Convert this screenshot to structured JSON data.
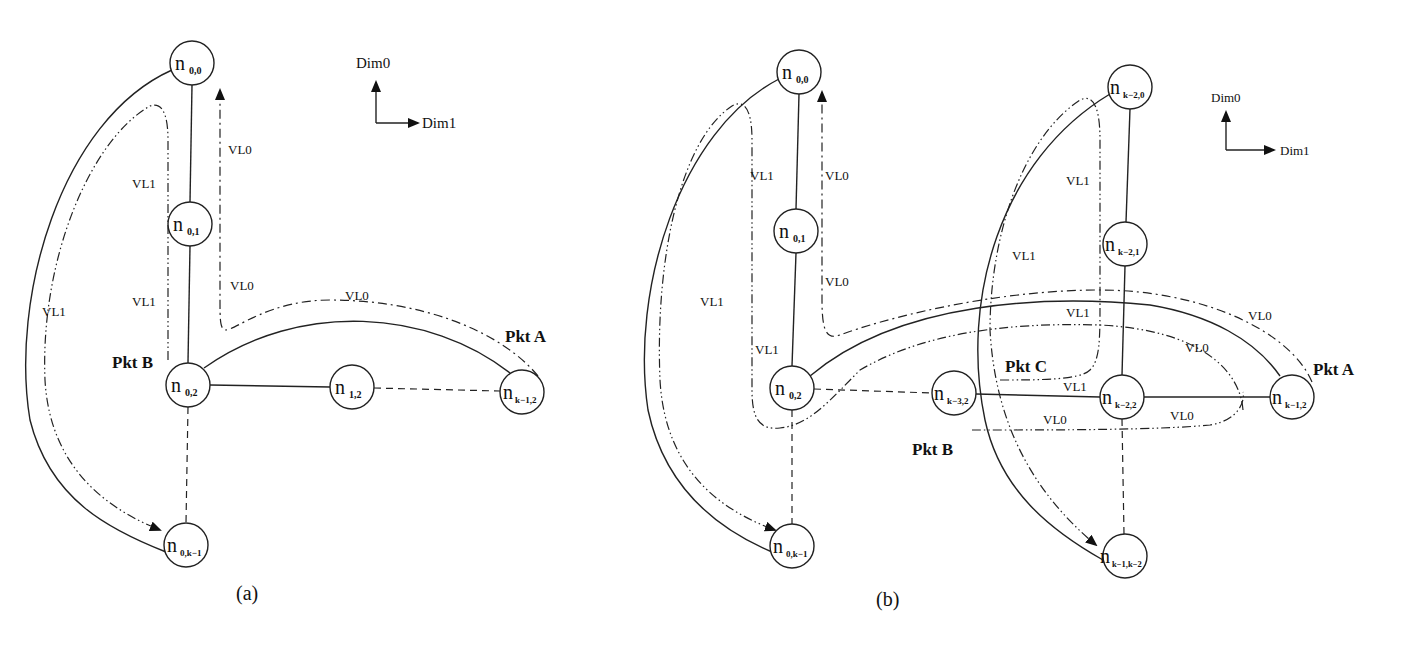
{
  "figure": {
    "panels": [
      {
        "caption": "(a)",
        "axes": {
          "up": "Dim0",
          "right": "Dim1"
        },
        "nodes": [
          {
            "id": "n00",
            "base": "n",
            "sub": "0,0"
          },
          {
            "id": "n01",
            "base": "n",
            "sub": "0,1"
          },
          {
            "id": "n02",
            "base": "n",
            "sub": "0,2"
          },
          {
            "id": "n12",
            "base": "n",
            "sub": "1,2"
          },
          {
            "id": "nk12",
            "base": "n",
            "sub": "k−1,2"
          },
          {
            "id": "n0k1",
            "base": "n",
            "sub": "0,k−1"
          }
        ],
        "vl_labels": [
          "VL0",
          "VL1",
          "VL0",
          "VL1",
          "VL1",
          "VL0"
        ],
        "packets": [
          "Pkt A",
          "Pkt B"
        ]
      },
      {
        "caption": "(b)",
        "axes": {
          "up": "Dim0",
          "right": "Dim1"
        },
        "nodes": [
          {
            "id": "n00",
            "base": "n",
            "sub": "0,0"
          },
          {
            "id": "n01",
            "base": "n",
            "sub": "0,1"
          },
          {
            "id": "n02",
            "base": "n",
            "sub": "0,2"
          },
          {
            "id": "n0k1",
            "base": "n",
            "sub": "0,k−1"
          },
          {
            "id": "nk32",
            "base": "n",
            "sub": "k−3,2"
          },
          {
            "id": "nk22",
            "base": "n",
            "sub": "k−2,2"
          },
          {
            "id": "nk12",
            "base": "n",
            "sub": "k−1,2"
          },
          {
            "id": "nk20",
            "base": "n",
            "sub": "k−2,0"
          },
          {
            "id": "nk21",
            "base": "n",
            "sub": "k−2,1"
          },
          {
            "id": "nk1k2",
            "base": "n",
            "sub": "k−1,k−2"
          }
        ],
        "vl_labels": [
          "VL1",
          "VL0",
          "VL0",
          "VL1",
          "VL1",
          "VL1",
          "VL1",
          "VL1",
          "VL0",
          "VL0",
          "VL1",
          "VL0",
          "VL0"
        ],
        "packets": [
          "Pkt A",
          "Pkt B",
          "Pkt C"
        ]
      }
    ]
  }
}
